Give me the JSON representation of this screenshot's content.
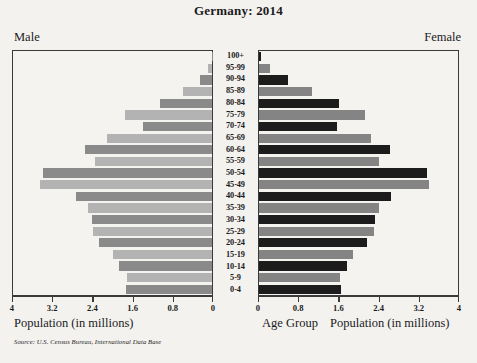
{
  "title": "Germany: 2014",
  "labels": {
    "male": "Male",
    "female": "Female",
    "age_group_caption": "Age Group",
    "population_caption_left": "Population (in millions)",
    "population_caption_right": "Population (in millions)",
    "source": "Source: U.S. Census Bureau, International Data Base"
  },
  "colors": {
    "male_dark": "#8a8a8a",
    "male_light": "#b3b3b3",
    "female_dark": "#1c1c1c",
    "female_light": "#848484",
    "axis": "#3a3a3a",
    "background": "#f3f2ef",
    "plot_background": "#f4f3f0"
  },
  "chart_data": {
    "type": "bar",
    "subtype": "population-pyramid",
    "title": "Germany: 2014",
    "xlabel": "Population (in millions)",
    "ylabel": "Age Group",
    "xlim": [
      0,
      4
    ],
    "xticks": [
      0,
      0.8,
      1.6,
      2.4,
      3.2,
      4
    ],
    "xticklabels_left": [
      "4",
      "3.2",
      "2.4",
      "1.6",
      "0.8",
      "0"
    ],
    "xticklabels_right": [
      "0",
      "0.8",
      "1.6",
      "2.4",
      "3.2",
      "4"
    ],
    "grid": false,
    "legend": "none",
    "categories": [
      "100+",
      "95-99",
      "90-94",
      "85-89",
      "80-84",
      "75-79",
      "70-74",
      "65-69",
      "60-64",
      "55-59",
      "50-54",
      "45-49",
      "40-44",
      "35-39",
      "30-34",
      "25-29",
      "20-24",
      "15-19",
      "10-14",
      "5-9",
      "0-4"
    ],
    "series": [
      {
        "name": "Male",
        "side": "left",
        "values": [
          0.01,
          0.07,
          0.23,
          0.57,
          1.04,
          1.74,
          1.37,
          2.08,
          2.52,
          2.33,
          3.36,
          3.43,
          2.7,
          2.46,
          2.38,
          2.36,
          2.25,
          1.98,
          1.85,
          1.69,
          1.71
        ]
      },
      {
        "name": "Female",
        "side": "right",
        "values": [
          0.04,
          0.21,
          0.58,
          1.05,
          1.6,
          2.1,
          1.55,
          2.22,
          2.61,
          2.39,
          3.34,
          3.38,
          2.63,
          2.39,
          2.31,
          2.29,
          2.14,
          1.88,
          1.76,
          1.61,
          1.63
        ]
      }
    ]
  }
}
